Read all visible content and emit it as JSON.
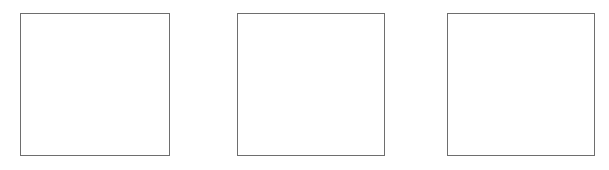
{
  "canvas": {
    "width": 609,
    "height": 170,
    "background_color": "#ffffff"
  },
  "style": {
    "frame_border_color": "#6e6e6e",
    "frame_fill_color": "#ffffff",
    "frame_border_width_px": 1
  },
  "frames": [
    {
      "id": "frame-1",
      "position": "left",
      "x": 20,
      "y": 13,
      "width": 150,
      "height": 143,
      "content": ""
    },
    {
      "id": "frame-2",
      "position": "center",
      "x": 237,
      "y": 13,
      "width": 148,
      "height": 143,
      "content": ""
    },
    {
      "id": "frame-3",
      "position": "right",
      "x": 447,
      "y": 13,
      "width": 148,
      "height": 143,
      "content": ""
    }
  ]
}
